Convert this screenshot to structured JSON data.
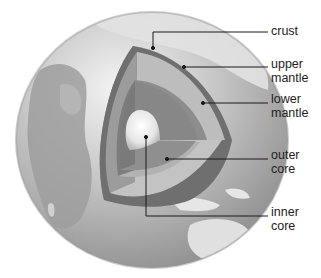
{
  "labels": {
    "crust": [
      "crust"
    ],
    "upper_mantle": [
      "upper",
      "mantle"
    ],
    "lower_mantle": [
      "lower",
      "mantle"
    ],
    "outer_core": [
      "outer",
      "core"
    ],
    "inner_core": [
      "inner",
      "core"
    ]
  },
  "colors": {
    "background": "#ffffff",
    "ocean": "#a9a9a9",
    "land": "#d6d6d6",
    "crust": "#6e6e6e",
    "upper_mantle": "#b9b9b9",
    "lower_mantle": "#8c8c8c",
    "outer_core": "#9a9a9a",
    "inner_core": "#f2f2f2",
    "leader_line": "#1a1a1a"
  }
}
